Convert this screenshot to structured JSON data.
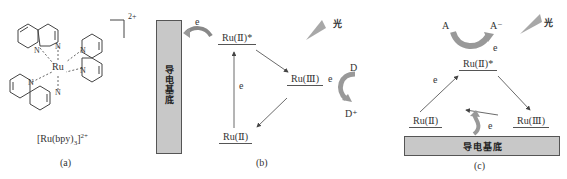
{
  "panel_a": {
    "caption": "(a)",
    "complex_label": "[Ru(bpy)",
    "complex_sub": "3",
    "complex_sup": "2+",
    "charge": "2+",
    "center_atom": "Ru",
    "n_atom": "N"
  },
  "panel_b": {
    "caption": "(b)",
    "substrate": "导电基底",
    "excited_state": "Ru(Ⅱ)*",
    "oxidized_state": "Ru(Ⅲ)",
    "ground_state": "Ru(Ⅱ)",
    "electron_label": "e",
    "donor": "D",
    "donor_oxidized": "D⁺",
    "light_label": "光"
  },
  "panel_c": {
    "caption": "(c)",
    "substrate": "导电基底",
    "excited_state": "Ru(Ⅱ)*",
    "oxidized_state": "Ru(Ⅲ)",
    "ground_state": "Ru(Ⅱ)",
    "electron_label": "e",
    "acceptor": "A",
    "acceptor_reduced": "A⁻",
    "light_label": "光"
  },
  "colors": {
    "substrate_fill": "#c8c8c8",
    "curved_arrow_fill": "#c4c4c4",
    "light_beam": "#a8a8a8",
    "line": "#444444"
  }
}
